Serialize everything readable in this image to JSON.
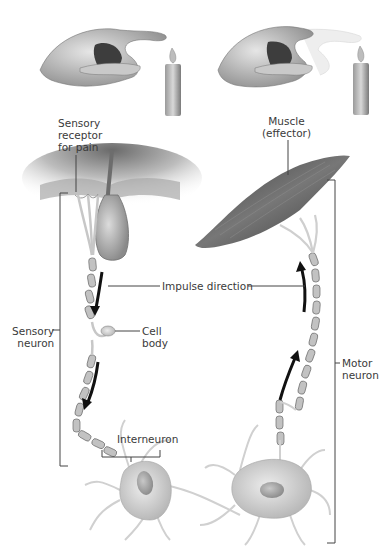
{
  "figure": {
    "panels": [
      {
        "name": "hand-near-flame",
        "description": "Hand with finger extended over candle flame"
      },
      {
        "name": "hand-withdrawn",
        "description": "Hand withdrawing finger from candle flame (motion blur)"
      }
    ]
  },
  "labels": {
    "sensory_receptor": [
      "Sensory",
      "receptor",
      "for pain"
    ],
    "muscle": [
      "Muscle",
      "(effector)"
    ],
    "impulse_direction": "Impulse direction",
    "cell_body": [
      "Cell",
      "body"
    ],
    "sensory_neuron": [
      "Sensory",
      "neuron"
    ],
    "interneuron": "Interneuron",
    "motor_neuron": [
      "Motor",
      "neuron"
    ]
  },
  "colors": {
    "line": "#444444",
    "skin_dark": "#8a8a8a",
    "skin_light": "#d9d9d9",
    "muscle": "#5a5a5a",
    "neuron": "#d4d4d4",
    "arrow": "#111111"
  }
}
